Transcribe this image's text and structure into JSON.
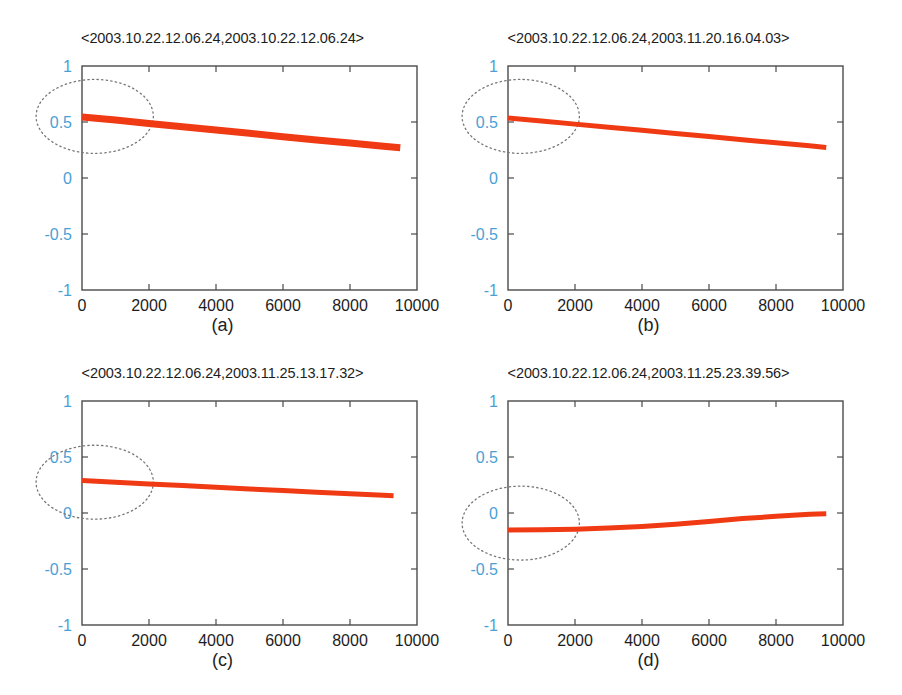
{
  "figure": {
    "background": "#ffffff",
    "width": 902,
    "height": 695,
    "accent_data_color": "#f03a14",
    "ytick_color": "#4b9fd5",
    "xtick_color": "#1d1d1d",
    "axis_color": "#4a4a4a",
    "annotation_color": "#777777"
  },
  "panels": [
    {
      "id": "a",
      "caption": "(a)",
      "title": "<2003.10.22.12.06.24,2003.10.22.12.06.24>",
      "chart_data": {
        "type": "line",
        "title": "<2003.10.22.12.06.24,2003.10.22.12.06.24>",
        "xlabel": "",
        "ylabel": "",
        "xlim": [
          0,
          10000
        ],
        "ylim": [
          -1,
          1
        ],
        "xticks": [
          0,
          2000,
          4000,
          6000,
          8000,
          10000
        ],
        "xticklabels": [
          "0",
          "2000",
          "4000",
          "6000",
          "8000",
          "10000"
        ],
        "yticks": [
          -1,
          -0.5,
          0,
          0.5,
          1
        ],
        "yticklabels": [
          "-1",
          "-0.5",
          "0",
          "0.5",
          "1"
        ],
        "grid": false,
        "legend": null,
        "line_width_px": 7,
        "series": [
          {
            "name": "correlation",
            "color": "#f03a14",
            "x": [
              0,
              1000,
              2000,
              3000,
              4000,
              5000,
              6000,
              7000,
              8000,
              9000,
              9500
            ],
            "y": [
              0.545,
              0.517,
              0.487,
              0.458,
              0.428,
              0.399,
              0.369,
              0.34,
              0.312,
              0.283,
              0.27
            ]
          }
        ],
        "annotations": [
          {
            "kind": "ellipse",
            "style": "dotted",
            "color": "#777777",
            "center_x": 380,
            "center_y": 0.55,
            "radius_x": 1750,
            "radius_y": 0.33
          }
        ]
      }
    },
    {
      "id": "b",
      "caption": "(b)",
      "title": "<2003.10.22.12.06.24,2003.11.20.16.04.03>",
      "chart_data": {
        "type": "line",
        "title": "<2003.10.22.12.06.24,2003.11.20.16.04.03>",
        "xlabel": "",
        "ylabel": "",
        "xlim": [
          0,
          10000
        ],
        "ylim": [
          -1,
          1
        ],
        "xticks": [
          0,
          2000,
          4000,
          6000,
          8000,
          10000
        ],
        "xticklabels": [
          "0",
          "2000",
          "4000",
          "6000",
          "8000",
          "10000"
        ],
        "yticks": [
          -1,
          -0.5,
          0,
          0.5,
          1
        ],
        "yticklabels": [
          "-1",
          "-0.5",
          "0",
          "0.5",
          "1"
        ],
        "grid": false,
        "legend": null,
        "line_width_px": 5,
        "series": [
          {
            "name": "correlation",
            "color": "#f03a14",
            "x": [
              0,
              1000,
              2000,
              3000,
              4000,
              5000,
              6000,
              7000,
              8000,
              9000,
              9500
            ],
            "y": [
              0.535,
              0.509,
              0.481,
              0.454,
              0.426,
              0.398,
              0.37,
              0.342,
              0.314,
              0.287,
              0.272
            ]
          }
        ],
        "annotations": [
          {
            "kind": "ellipse",
            "style": "dotted",
            "color": "#777777",
            "center_x": 380,
            "center_y": 0.55,
            "radius_x": 1750,
            "radius_y": 0.33
          }
        ]
      }
    },
    {
      "id": "c",
      "caption": "(c)",
      "title": "<2003.10.22.12.06.24,2003.11.25.13.17.32>",
      "chart_data": {
        "type": "line",
        "title": "<2003.10.22.12.06.24,2003.11.25.13.17.32>",
        "xlabel": "",
        "ylabel": "",
        "xlim": [
          0,
          10000
        ],
        "ylim": [
          -1,
          1
        ],
        "xticks": [
          0,
          2000,
          4000,
          6000,
          8000,
          10000
        ],
        "xticklabels": [
          "0",
          "2000",
          "4000",
          "6000",
          "8000",
          "10000"
        ],
        "yticks": [
          -1,
          -0.5,
          0,
          0.5,
          1
        ],
        "yticklabels": [
          "-1",
          "-0.5",
          "0",
          "0.5",
          "1"
        ],
        "grid": false,
        "legend": null,
        "line_width_px": 5,
        "series": [
          {
            "name": "correlation",
            "color": "#f03a14",
            "x": [
              0,
              1000,
              2000,
              3000,
              4000,
              5000,
              6000,
              7000,
              8000,
              9000,
              9300
            ],
            "y": [
              0.29,
              0.275,
              0.26,
              0.245,
              0.23,
              0.215,
              0.2,
              0.186,
              0.172,
              0.159,
              0.155
            ]
          }
        ],
        "annotations": [
          {
            "kind": "ellipse",
            "style": "dotted",
            "color": "#777777",
            "center_x": 380,
            "center_y": 0.275,
            "radius_x": 1750,
            "radius_y": 0.33
          }
        ]
      }
    },
    {
      "id": "d",
      "caption": "(d)",
      "title": "<2003.10.22.12.06.24,2003.11.25.23.39.56>",
      "chart_data": {
        "type": "line",
        "title": "<2003.10.22.12.06.24,2003.11.25.23.39.56>",
        "xlabel": "",
        "ylabel": "",
        "xlim": [
          0,
          10000
        ],
        "ylim": [
          -1,
          1
        ],
        "xticks": [
          0,
          2000,
          4000,
          6000,
          8000,
          10000
        ],
        "xticklabels": [
          "0",
          "2000",
          "4000",
          "6000",
          "8000",
          "10000"
        ],
        "yticks": [
          -1,
          -0.5,
          0,
          0.5,
          1
        ],
        "yticklabels": [
          "-1",
          "-0.5",
          "0",
          "0.5",
          "1"
        ],
        "grid": false,
        "legend": null,
        "line_width_px": 5,
        "series": [
          {
            "name": "correlation",
            "color": "#f03a14",
            "x": [
              0,
              1000,
              2000,
              3000,
              4000,
              5000,
              6000,
              7000,
              8000,
              9000,
              9500
            ],
            "y": [
              -0.152,
              -0.15,
              -0.145,
              -0.135,
              -0.12,
              -0.1,
              -0.075,
              -0.05,
              -0.03,
              -0.012,
              -0.006
            ]
          }
        ],
        "annotations": [
          {
            "kind": "ellipse",
            "style": "dotted",
            "color": "#777777",
            "center_x": 380,
            "center_y": -0.09,
            "radius_x": 1750,
            "radius_y": 0.33
          }
        ]
      }
    }
  ]
}
